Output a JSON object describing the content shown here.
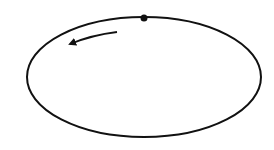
{
  "diagram": {
    "ellipse": {
      "cx": 144,
      "cy": 77,
      "rx": 117,
      "ry": 60,
      "stroke": "#111111",
      "stroke_width": 2
    },
    "point": {
      "cx": 144,
      "cy": 18,
      "r": 3.5,
      "fill": "#111111"
    },
    "direction_arrow": {
      "direction": "counterclockwise",
      "path": "M117,32 Q92,35 70,44",
      "stroke": "#111111",
      "stroke_width": 1.8
    }
  }
}
